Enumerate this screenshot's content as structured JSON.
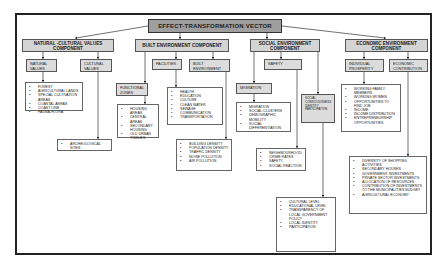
{
  "root": {
    "label": "EFFECT-TRANSFORMATION VECTOR"
  },
  "components": {
    "natural": {
      "label": "NATURAL -CULTURAL VALUES COMPONENT",
      "natural_values": {
        "label": "NATURAL VALUES",
        "items": [
          "FOREST",
          "AGRICULTURAL LANDS",
          "SPECIAL CULTIVATION AREAS",
          "COASTAL AREAS",
          "COAST LINE",
          "FAUNA-FLORA"
        ]
      },
      "cultural_values": {
        "label": "CULTURAL VALUES",
        "items": [
          "ARCHEOLOGICAL SITES"
        ]
      }
    },
    "built": {
      "label": "BUILT ENVIRONMENT COMPONENT",
      "functional_zones": {
        "label": "FUNCTIONAL ZONES",
        "items": [
          "HOUSING AREAS",
          "CENTRAL AREAS",
          "SECONDARY HOUSING",
          "OLD URBAN TISSUES"
        ]
      },
      "facilities": {
        "label": "FACILITIES",
        "items": [
          "HEALTH",
          "EDUCATION",
          "CULTURE",
          "CLEAN WATER",
          "SEWAGE",
          "COMMUNICATION",
          "TRANSPORTATION"
        ]
      },
      "built_environment": {
        "label": "BUILT ENVIRONMENT",
        "items": [
          "BUILDING DENSITY",
          "POPULATION DENSITY",
          "TRAFFIC DENSITY",
          "NOISE POLLUTION",
          "AIR POLLUTION"
        ]
      }
    },
    "social": {
      "label": "SOCIAL ENVIRONMENT COMPONENT",
      "migration": {
        "label": "MIGRATION",
        "items": [
          "MIGRATION",
          "SOCIAL CLUSTERS",
          "DEMOGRAPHIC MOBILITY",
          "SOCIAL DIFFERENTIATION"
        ]
      },
      "safety": {
        "label": "SAFETY",
        "items": [
          "NEIGHBOURHOOD",
          "CRIME RATES",
          "SAFETY",
          "SOCIAL REACTION"
        ]
      },
      "social_participation": {
        "label": "SOCIAL CONSCIOUSNESS IDENTITY PARTICIPATION",
        "items": [
          "CULTURAL LEVEL",
          "EDUCATIONAL LEVEL",
          "TRANSPARENCY OF LOCAL GOVERNMENT POLICY",
          "LOCAL IDENTITY",
          "PARTICIPATION"
        ]
      }
    },
    "economic": {
      "label": "ECONOMIC ENVIRONMENT COMPONENT",
      "individual_prosperity": {
        "label": "INDIVIDUAL PROSPERITY",
        "items": [
          "WORKING FAMILY MEMBERS",
          "WORKING WOMEN",
          "OPPORTUNITIES TO FIND JOB",
          "INCOME",
          "INCOME DISTRIBUTION",
          "ENTREPRENEURSHIP OPPORTUNITIES"
        ]
      },
      "economic_contribution": {
        "label": "ECONOMIC CONTRIBUTION",
        "items": [
          "DIVERSITY OF SHOPPING ACTIVITIES",
          "SECONDARY HOUSES",
          "GOVERNMENT INVESTMENTS",
          "PRIVATE SECTOR INVESTMENTS",
          "ALLOCATION OF RESOURCES",
          "CONTRIBUTION OF INVESTMENTS TO THE MUNICIPALITIES BUDGET",
          "AGRICULTURAL ECONOMY"
        ]
      }
    }
  },
  "colors": {
    "root_fill": "#9e9e9e",
    "component_fill": "#d4d4d4",
    "subbox_fill": "#dcdcdc",
    "line": "#333333"
  }
}
